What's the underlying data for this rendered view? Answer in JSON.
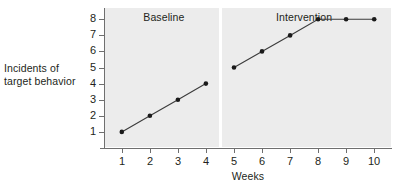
{
  "chart_data": {
    "type": "line",
    "title": "",
    "xlabel": "Weeks",
    "ylabel": "Incidents of target behavior",
    "ylabel_lines": [
      "Incidents of",
      "target behavior"
    ],
    "x": [
      1,
      2,
      3,
      4,
      5,
      6,
      7,
      8,
      9,
      10
    ],
    "xtick_labels": [
      "1",
      "2",
      "3",
      "4",
      "5",
      "6",
      "7",
      "8",
      "9",
      "10"
    ],
    "ytick_labels": [
      "1",
      "2",
      "3",
      "4",
      "5",
      "6",
      "7",
      "8"
    ],
    "xlim": [
      0.4,
      10.6
    ],
    "ylim": [
      0,
      8.7
    ],
    "grid": false,
    "legend": "none",
    "marker": "filled-circle",
    "series": [
      {
        "name": "Baseline",
        "x": [
          1,
          2,
          3,
          4
        ],
        "values": [
          1,
          2,
          3,
          4
        ]
      },
      {
        "name": "Intervention",
        "x": [
          5,
          6,
          7,
          8,
          9,
          10
        ],
        "values": [
          5,
          6,
          7,
          8,
          8,
          8
        ]
      }
    ],
    "annotations": [
      {
        "name": "phase-label-baseline",
        "text": "Baseline",
        "x": 2.5
      },
      {
        "name": "phase-label-intervention",
        "text": "Intervention",
        "x": 7.5
      },
      {
        "name": "phase-divider",
        "text": "",
        "x": 4.5
      }
    ],
    "colors": {
      "plot_background": "#ececec",
      "page_background": "#ffffff",
      "line": "#3b3b3b",
      "marker": "#1a1a1a",
      "axis": "#6f6f6f",
      "text": "#231f20",
      "divider": "#ffffff"
    }
  },
  "labels": {
    "y_axis_title_line1": "Incidents of",
    "y_axis_title_line2": "target behavior",
    "x_axis_title": "Weeks",
    "phase_baseline": "Baseline",
    "phase_intervention": "Intervention"
  }
}
